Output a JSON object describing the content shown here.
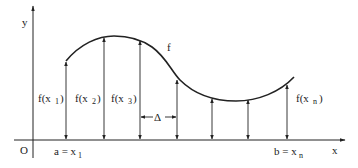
{
  "diagram": {
    "axes": {
      "y_label": "y",
      "x_label": "x",
      "origin_label": "O"
    },
    "curve_label": "f",
    "ordinates": [
      {
        "label": "f(x",
        "sub": "1",
        "close": ")"
      },
      {
        "label": "f(x",
        "sub": "2",
        "close": ")"
      },
      {
        "label": "f(x",
        "sub": "3",
        "close": ")"
      },
      {
        "label": "f(x",
        "sub": "n",
        "close": ")"
      }
    ],
    "spacing_label": "Δ",
    "left_endpoint": {
      "label": "a = x",
      "sub": "1"
    },
    "right_endpoint": {
      "label": "b = x",
      "sub": "n"
    },
    "colors": {
      "ink": "#222222",
      "background": "#ffffff"
    }
  }
}
